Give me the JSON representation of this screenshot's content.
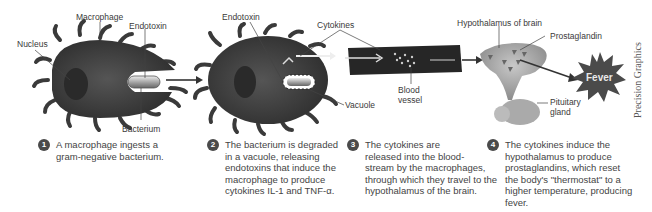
{
  "diagram": {
    "labels": {
      "macrophage": "Macrophage",
      "nucleus": "Nucleus",
      "endotoxin_1": "Endotoxin",
      "bacterium": "Bacterium",
      "endotoxin_2": "Endotoxin",
      "cytokines": "Cytokines",
      "vacuole": "Vacuole",
      "blood_vessel_line1": "Blood",
      "blood_vessel_line2": "vessel",
      "hypothalamus": "Hypothalamus of brain",
      "prostaglandin": "Prostaglandin",
      "pituitary_line1": "Pituitary",
      "pituitary_line2": "gland",
      "fever": "Fever"
    },
    "steps": [
      {
        "number": "1",
        "text": "A macrophage ingests a\ngram-negative bacterium."
      },
      {
        "number": "2",
        "text": "The bacterium is degraded\nin a vacuole, releasing\nendotoxins that induce the\nmacrophage to produce\ncytokines IL-1 and TNF-α."
      },
      {
        "number": "3",
        "text": "The cytokines are\nreleased into the blood-\nstream by the macrophages,\nthrough which they travel to the\nhypothalamus of the brain."
      },
      {
        "number": "4",
        "text": "The cytokines induce the\nhypothalamus to produce\nprostaglandins, which reset\nthe body's \"thermostat\" to a\nhigher temperature, producing\nfever."
      }
    ],
    "credit": "Precision Graphics",
    "colors": {
      "cell": "#3c3c3c",
      "vessel": "#2a2a2a",
      "brain": "#a8a8a8",
      "fever_burst": "#4a4a4a",
      "arrow": "#333333"
    }
  }
}
